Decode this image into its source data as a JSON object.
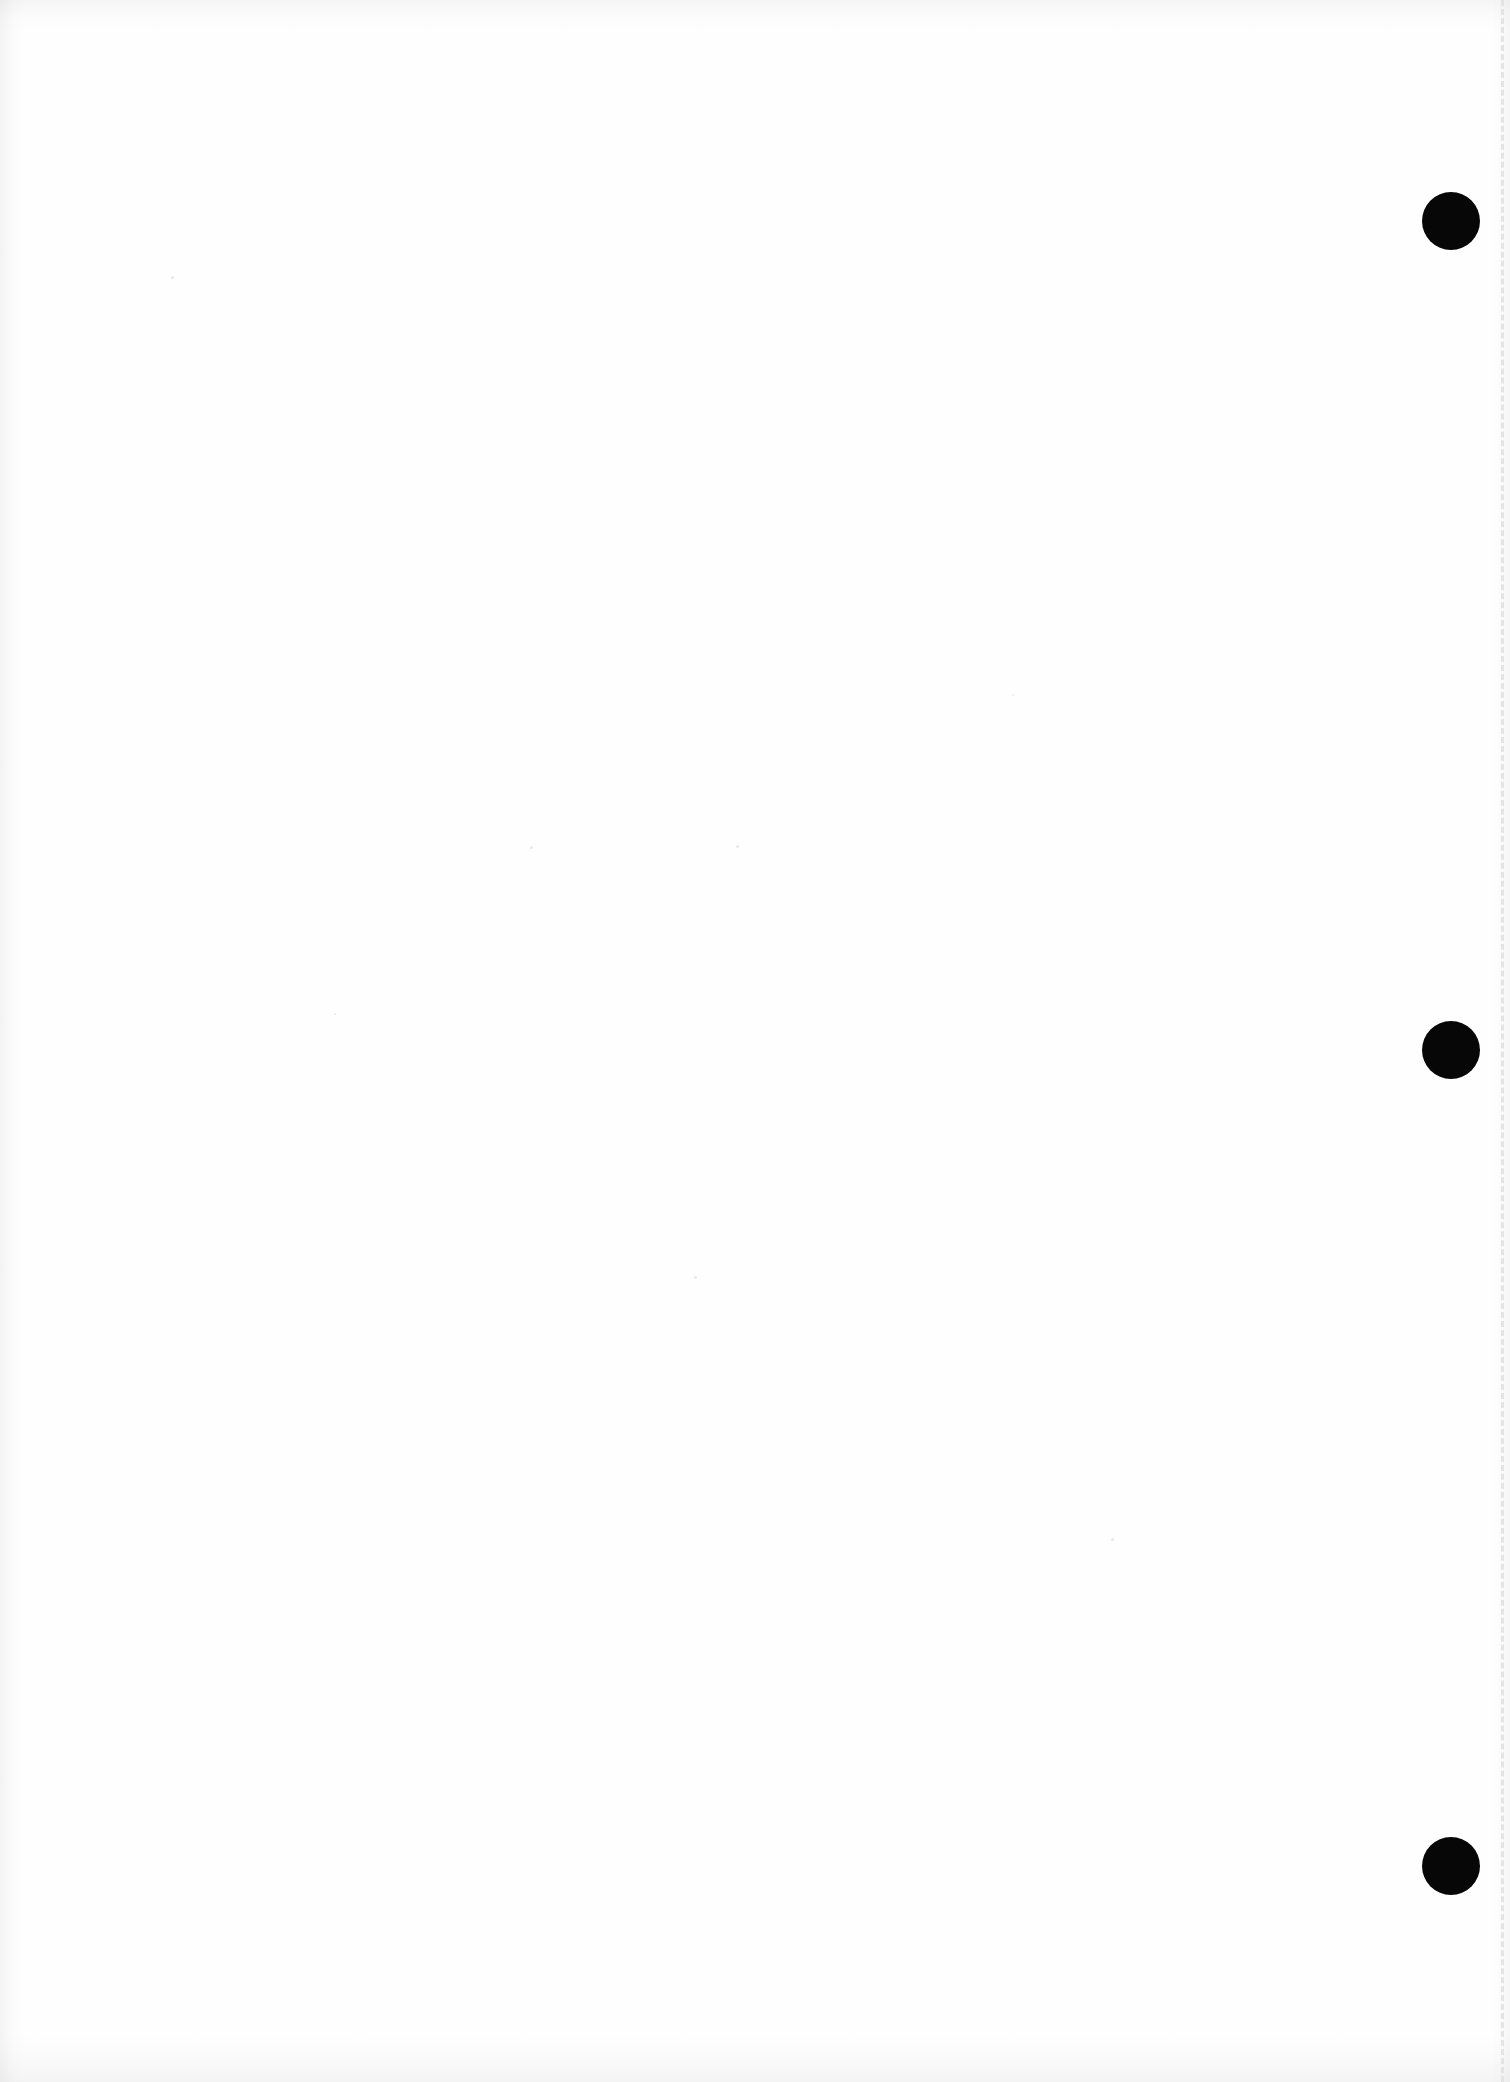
{
  "document": {
    "kind": "scanned-page",
    "title": "Blank scanned page",
    "page_width": 1510,
    "page_height": 2082,
    "background_color": "#ffffff",
    "paper_color": "#fefefe",
    "body_text": "",
    "note": "Page contains no printed text or figures."
  },
  "margin_rule": {
    "name": "dashed-margin-line",
    "color": "#e2e2e2",
    "x": 1501,
    "style": "dashed",
    "thickness_px": 3,
    "orientation": "vertical",
    "label": ""
  },
  "margin_dots": {
    "color": "#070707",
    "count": 3,
    "diameter_px": 58,
    "center_x": 1451,
    "items": [
      {
        "name": "margin-dot-top",
        "center_y": 221,
        "label": ""
      },
      {
        "name": "margin-dot-middle",
        "center_y": 1050,
        "label": ""
      },
      {
        "name": "margin-dot-bottom",
        "center_y": 1866,
        "label": ""
      }
    ]
  },
  "specks": [
    {
      "x": 171,
      "y": 276,
      "d": 3
    },
    {
      "x": 530,
      "y": 846,
      "d": 3
    },
    {
      "x": 736,
      "y": 845,
      "d": 3
    },
    {
      "x": 694,
      "y": 1276,
      "d": 3
    },
    {
      "x": 1111,
      "y": 1538,
      "d": 3
    },
    {
      "x": 334,
      "y": 1013,
      "d": 2
    },
    {
      "x": 1012,
      "y": 694,
      "d": 2
    }
  ]
}
